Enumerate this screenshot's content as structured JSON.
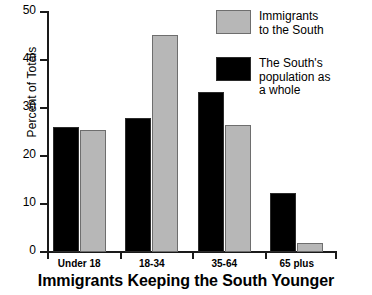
{
  "chart_data": {
    "type": "bar",
    "title": "Immigrants Keeping the South Younger",
    "xlabel": "",
    "ylabel": "Percent of Totals",
    "ylim": [
      0,
      50
    ],
    "yticks": [
      "0",
      "10",
      "20",
      "30",
      "40",
      "50"
    ],
    "grid": false,
    "legend_position": "top-right",
    "categories": [
      "Under 18",
      "18-34",
      "35-64",
      "65 plus"
    ],
    "series": [
      {
        "name": "The South's population as a whole",
        "color": "#000000",
        "values": [
          26,
          28,
          33.3,
          12.3
        ]
      },
      {
        "name": "Immigrants to the South",
        "color": "#b7b7b7",
        "values": [
          25.5,
          45.2,
          26.5,
          1.9
        ]
      }
    ]
  },
  "legend": {
    "entries": [
      {
        "label_line1": "Immigrants",
        "label_line2": "to the South",
        "swatch": "gray-swatch"
      },
      {
        "label_line1": "The South's",
        "label_line2": "population as",
        "label_line3": "a whole",
        "swatch": "black-swatch"
      }
    ]
  }
}
